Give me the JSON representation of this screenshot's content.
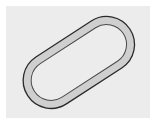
{
  "figure": {
    "shape": "racetrack-ring",
    "colors": {
      "background": "#ffffff",
      "panel": "#ececec",
      "ring_fill": "#cfcfcf",
      "outer_stroke": "#2a2a2a",
      "inner_stroke": "#4a4a4a",
      "inner_fill": "#ececec"
    }
  }
}
